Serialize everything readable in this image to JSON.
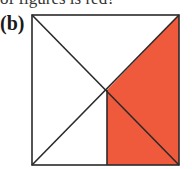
{
  "top_text": "of figures is red?",
  "label": "(b)",
  "figure": {
    "shape": "square",
    "square": {
      "x1": 32,
      "y1": 15,
      "x2": 179,
      "y2": 165
    },
    "center": {
      "x": 107,
      "y": 90
    },
    "fill_color": "#F05A3C",
    "stroke_color": "#2a2a2a",
    "shaded_regions": [
      "right-triangle-upper",
      "bottom-right-rectangle-quadrant"
    ]
  }
}
